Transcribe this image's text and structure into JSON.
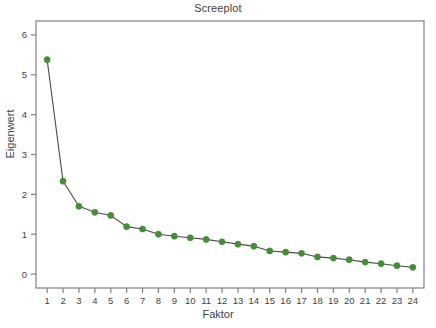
{
  "chart_data": {
    "type": "line",
    "title": "Screeplot",
    "xlabel": "Faktor",
    "ylabel": "Eigenwert",
    "x": [
      1,
      2,
      3,
      4,
      5,
      6,
      7,
      8,
      9,
      10,
      11,
      12,
      13,
      14,
      15,
      16,
      17,
      18,
      19,
      20,
      21,
      22,
      23,
      24
    ],
    "values": [
      5.38,
      2.33,
      1.7,
      1.55,
      1.47,
      1.19,
      1.13,
      1.0,
      0.95,
      0.91,
      0.87,
      0.81,
      0.75,
      0.7,
      0.58,
      0.55,
      0.52,
      0.43,
      0.4,
      0.36,
      0.3,
      0.26,
      0.21,
      0.17
    ],
    "categories": [
      "1",
      "2",
      "3",
      "4",
      "5",
      "6",
      "7",
      "8",
      "9",
      "10",
      "11",
      "12",
      "13",
      "14",
      "15",
      "16",
      "17",
      "18",
      "19",
      "20",
      "21",
      "22",
      "23",
      "24"
    ],
    "xtick_labels": [
      "1",
      "2",
      "3",
      "4",
      "5",
      "6",
      "7",
      "8",
      "9",
      "10",
      "11",
      "12",
      "13",
      "14",
      "15",
      "16",
      "17",
      "18",
      "19",
      "20",
      "21",
      "22",
      "23",
      "24"
    ],
    "ytick_labels": [
      "0",
      "1",
      "2",
      "3",
      "4",
      "5",
      "6"
    ],
    "yticks": [
      0,
      1,
      2,
      3,
      4,
      5,
      6
    ],
    "ylim": [
      -0.35,
      6.35
    ],
    "xlim": [
      0.3,
      24.7
    ],
    "grid": false,
    "legend": "none",
    "marker_color": "#4a8a3c",
    "line_color": "#4a4a4a",
    "axis_color": "#808080",
    "text_color": "#3f3f3f",
    "background": "#ffffff"
  }
}
